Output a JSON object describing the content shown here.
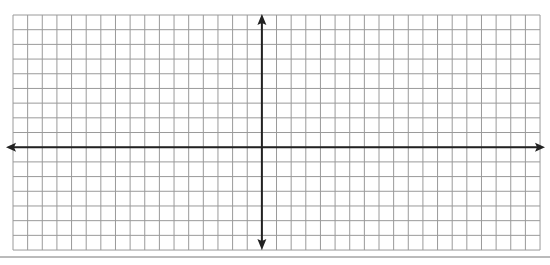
{
  "diagram": {
    "type": "coordinate-grid",
    "grid": {
      "left": 13,
      "top": 15,
      "columns": 36,
      "rows": 16,
      "cell_width": 14.64,
      "cell_height": 14.69,
      "line_color": "#9a9a9a"
    },
    "axes": {
      "x_axis_row_line": 9,
      "y_axis_column_line": 17,
      "color": "#222222",
      "x_axis": {
        "x_start": 6,
        "x_end": 545,
        "arrows": "both"
      },
      "y_axis": {
        "y_start": 14,
        "y_end": 250,
        "arrows": "both"
      }
    },
    "bottom_rule": {
      "y": 257,
      "color": "#777777"
    }
  }
}
